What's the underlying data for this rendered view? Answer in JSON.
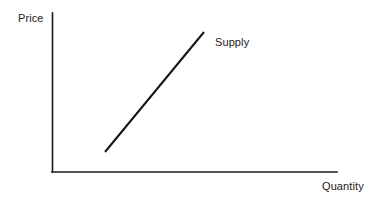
{
  "figure": {
    "background_color": "#ffffff",
    "axis_color": "#1a1a1a",
    "curve_color": "#141414",
    "text_color": "#1c1c1c"
  },
  "labels": {
    "y_axis": "Price",
    "x_axis": "Quantity",
    "curve": "Supply"
  },
  "chart_data": {
    "type": "line",
    "title": "",
    "xlabel": "Quantity",
    "ylabel": "Price",
    "grid": false,
    "legend": "none",
    "annotations": [
      {
        "text": "Supply",
        "x_px": 215,
        "y_px": 36,
        "describes": "supply-curve"
      }
    ],
    "axes": {
      "x_axis_px": {
        "x1": 52,
        "y1": 172,
        "x2": 337,
        "y2": 172
      },
      "y_axis_px": {
        "x1": 52,
        "y1": 13,
        "x2": 52,
        "y2": 172
      },
      "tick_labels_x": [],
      "tick_labels_y": [],
      "xlim": [
        0,
        1
      ],
      "ylim": [
        0,
        1
      ]
    },
    "series": [
      {
        "name": "Supply",
        "type": "line",
        "color": "#141414",
        "linewidth_px": 2,
        "points_px": [
          {
            "x": 105,
            "y": 152
          },
          {
            "x": 204,
            "y": 32
          }
        ],
        "x": [
          0.186,
          0.533
        ],
        "y": [
          0.126,
          0.881
        ],
        "slope_note": "upward-sloping"
      }
    ]
  }
}
